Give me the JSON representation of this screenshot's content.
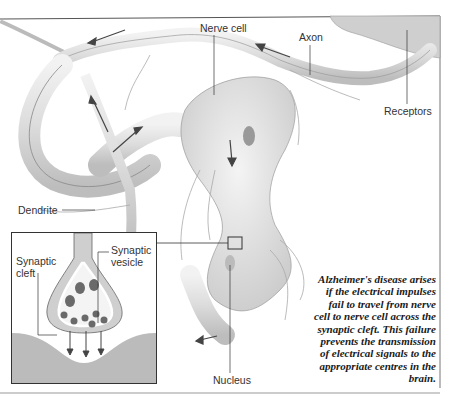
{
  "figure": {
    "labels": {
      "nerve_cell": "Nerve cell",
      "axon": "Axon",
      "receptors": "Receptors",
      "dendrite": "Dendrite",
      "nucleus": "Nucleus",
      "synaptic_cleft": "Synaptic cleft",
      "synaptic_vesicle": "Synaptic vesicle"
    },
    "inset": {
      "labels": {
        "synaptic_cleft_line1": "Synaptic",
        "synaptic_cleft_line2": "cleft",
        "synaptic_vesicle_line1": "Synaptic",
        "synaptic_vesicle_line2": "vesicle"
      }
    },
    "caption_lines": [
      "Alzheimer's disease arises",
      "if the electrical impulses",
      "fail to travel from nerve",
      "cell to nerve cell across the",
      "synaptic cleft. This failure",
      "prevents the transmission",
      "of electrical signals to the",
      "appropriate centres in the",
      "brain."
    ],
    "colors": {
      "ink": "#333333",
      "shade": "#cfcfcf",
      "vesicle": "#6a6a6a",
      "background": "#ffffff"
    }
  }
}
